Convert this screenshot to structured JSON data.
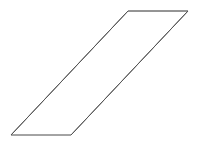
{
  "canvas": {
    "width": 199,
    "height": 145,
    "background_color": "#ffffff"
  },
  "figure": {
    "name": "parallelogram",
    "label": "parallelogram",
    "stroke_color": "#5a5a5a",
    "fill_color": "none",
    "stroke_width": 1,
    "vertices": [
      {
        "name": "top-left",
        "x": 128,
        "y": 11
      },
      {
        "name": "top-right",
        "x": 188,
        "y": 11
      },
      {
        "name": "bottom-right",
        "x": 71,
        "y": 135
      },
      {
        "name": "bottom-left",
        "x": 11,
        "y": 135
      }
    ],
    "points_string": "128,11 188,11 71,135 11,135",
    "edges": [
      {
        "name": "top-edge",
        "from": "top-left",
        "to": "top-right",
        "color": "#7c7c7c",
        "orientation": "horizontal"
      },
      {
        "name": "right-edge",
        "from": "top-right",
        "to": "bottom-right",
        "color": "#555555",
        "orientation": "diagonal"
      },
      {
        "name": "bottom-edge",
        "from": "bottom-right",
        "to": "bottom-left",
        "color": "#9a9a9a",
        "orientation": "horizontal"
      },
      {
        "name": "left-edge",
        "from": "bottom-left",
        "to": "top-left",
        "color": "#555555",
        "orientation": "diagonal"
      }
    ]
  }
}
